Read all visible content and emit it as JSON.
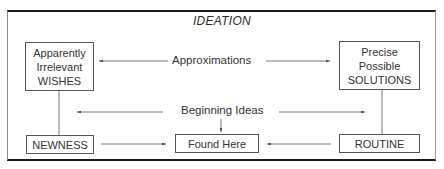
{
  "diagram": {
    "title": "IDEATION",
    "nodes": {
      "wishes": {
        "lines": [
          "Apparently",
          "Irrelevant",
          "WISHES"
        ]
      },
      "solutions": {
        "lines": [
          "Precise",
          "Possible",
          "SOLUTIONS"
        ]
      },
      "newness": {
        "label": "NEWNESS"
      },
      "found_here": {
        "label": "Found Here"
      },
      "routine": {
        "label": "ROUTINE"
      }
    },
    "edge_labels": {
      "approximations": "Approximations",
      "beginning_ideas": "Beginning Ideas"
    },
    "edges": [
      {
        "label": "Approximations",
        "to": "wishes",
        "direction": "left"
      },
      {
        "label": "Approximations",
        "to": "solutions",
        "direction": "right"
      },
      {
        "label": "Beginning Ideas",
        "to": "left",
        "direction": "left"
      },
      {
        "label": "Beginning Ideas",
        "to": "right",
        "direction": "right"
      },
      {
        "label": "Beginning Ideas",
        "to": "found_here",
        "direction": "down"
      },
      {
        "from": "newness",
        "to": "found_here",
        "direction": "right"
      },
      {
        "from": "routine",
        "to": "found_here",
        "direction": "left"
      },
      {
        "from": "wishes",
        "to": "newness",
        "type": "line"
      },
      {
        "from": "solutions",
        "to": "routine",
        "type": "line"
      }
    ],
    "colors": {
      "frame": "#1a1a1a",
      "box_border": "#555555",
      "text": "#333333"
    }
  }
}
